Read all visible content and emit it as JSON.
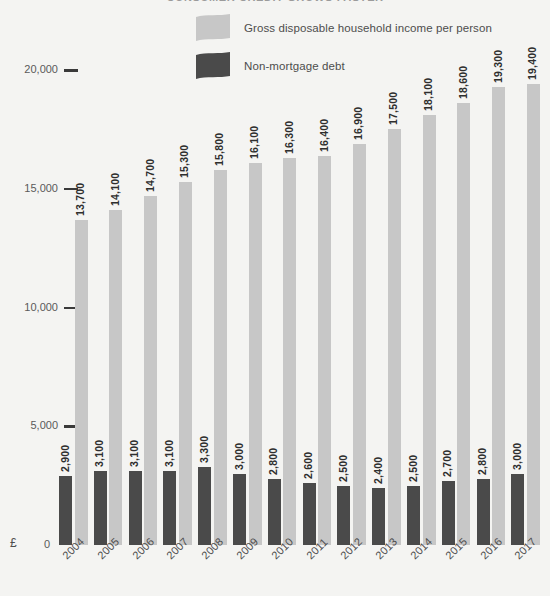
{
  "chart_data": {
    "type": "bar",
    "title": "CONSUMER CREDIT GROWS FASTER",
    "xlabel": "",
    "ylabel": "£",
    "ylim": [
      0,
      20000
    ],
    "yticks": [
      "0",
      "5,000",
      "10,000",
      "15,000",
      "20,000"
    ],
    "ytick_values": [
      0,
      5000,
      10000,
      15000,
      20000
    ],
    "grid": false,
    "legend_position": "top-center",
    "categories": [
      "2004",
      "2005",
      "2006",
      "2007",
      "2008",
      "2009",
      "2010",
      "2011",
      "2012",
      "2013",
      "2014",
      "2015",
      "2016",
      "2017"
    ],
    "series": [
      {
        "name": "Non-mortgage debt",
        "color": "#4a4a4a",
        "values": [
          2900,
          3100,
          3100,
          3100,
          3300,
          3000,
          2800,
          2600,
          2500,
          2400,
          2500,
          2700,
          2800,
          3000
        ],
        "labels": [
          "2,900",
          "3,100",
          "3,100",
          "3,100",
          "3,300",
          "3,000",
          "2,800",
          "2,600",
          "2,500",
          "2,400",
          "2,500",
          "2,700",
          "2,800",
          "3,000"
        ]
      },
      {
        "name": "Gross disposable household income per person",
        "color": "#c7c7c7",
        "values": [
          13700,
          14100,
          14700,
          15300,
          15800,
          16100,
          16300,
          16400,
          16900,
          17500,
          18100,
          18600,
          19300,
          19400
        ],
        "labels": [
          "13,700",
          "14,100",
          "14,700",
          "15,300",
          "15,800",
          "16,100",
          "16,300",
          "16,400",
          "16,900",
          "17,500",
          "18,100",
          "18,600",
          "19,300",
          "19,400"
        ]
      }
    ]
  },
  "legend": {
    "items": [
      {
        "label": "Gross disposable household income per person",
        "color": "#c7c7c7"
      },
      {
        "label": "Non-mortgage debt",
        "color": "#4a4a4a"
      }
    ]
  },
  "axis": {
    "currency_symbol": "£",
    "zero_label": "0"
  }
}
